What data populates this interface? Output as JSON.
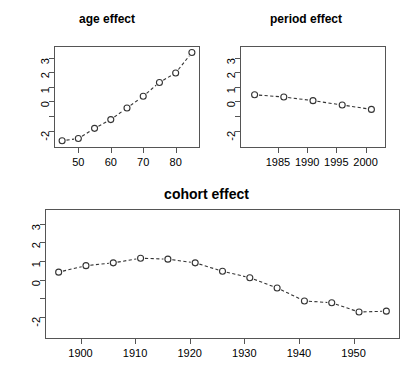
{
  "chart_data": [
    {
      "type": "line",
      "name": "age-effect",
      "title": "age effect",
      "xlabel": "",
      "ylabel": "",
      "x": [
        45,
        50,
        55,
        60,
        65,
        70,
        75,
        80,
        85
      ],
      "values": [
        -2.7,
        -2.55,
        -1.85,
        -1.25,
        -0.45,
        0.35,
        1.3,
        1.95,
        3.35
      ],
      "xlim": [
        42.5,
        87.5
      ],
      "ylim": [
        -3.2,
        3.8
      ],
      "xticks": [
        50,
        60,
        70,
        80
      ],
      "xtick_labels": [
        "50",
        "60",
        "70",
        "80"
      ],
      "yticks": [
        3,
        2,
        1,
        0,
        -1,
        -2
      ],
      "ytick_labels": [
        "3",
        "2",
        "1",
        "0",
        "",
        "-2"
      ],
      "grid": false,
      "legend": "none",
      "marker": "open-circle",
      "linestyle": "dashed"
    },
    {
      "type": "line",
      "name": "period-effect",
      "title": "period effect",
      "xlabel": "",
      "ylabel": "",
      "x": [
        1981,
        1986,
        1991,
        1996,
        2001
      ],
      "values": [
        0.45,
        0.3,
        0.05,
        -0.25,
        -0.55
      ],
      "xlim": [
        1978.5,
        2003.5
      ],
      "ylim": [
        -3.2,
        3.8
      ],
      "xticks": [
        1985,
        1990,
        1995,
        2000
      ],
      "xtick_labels": [
        "1985",
        "1990",
        "1995",
        "2000"
      ],
      "yticks": [
        3,
        2,
        1,
        0,
        -1,
        -2
      ],
      "ytick_labels": [
        "3",
        "2",
        "1",
        "0",
        "",
        "-2"
      ],
      "grid": false,
      "legend": "none",
      "marker": "open-circle",
      "linestyle": "dashed"
    },
    {
      "type": "line",
      "name": "cohort-effect",
      "title": "cohort effect",
      "xlabel": "",
      "ylabel": "",
      "x": [
        1896,
        1901,
        1906,
        1911,
        1916,
        1921,
        1926,
        1931,
        1936,
        1941,
        1946,
        1951,
        1956
      ],
      "values": [
        0.4,
        0.75,
        0.9,
        1.15,
        1.1,
        0.9,
        0.45,
        0.1,
        -0.45,
        -1.15,
        -1.25,
        -1.75,
        -1.7
      ],
      "xlim": [
        1893.5,
        1958.5
      ],
      "ylim": [
        -3.2,
        3.8
      ],
      "xticks": [
        1900,
        1910,
        1920,
        1930,
        1940,
        1950
      ],
      "xtick_labels": [
        "1900",
        "1910",
        "1920",
        "1930",
        "1940",
        "1950"
      ],
      "yticks": [
        3,
        2,
        1,
        0,
        -1,
        -2
      ],
      "ytick_labels": [
        "3",
        "2",
        "1",
        "0",
        "",
        "-2"
      ],
      "grid": false,
      "legend": "none",
      "marker": "open-circle",
      "linestyle": "dashed"
    }
  ],
  "style": {
    "axis_color": "#555555",
    "line_color": "#333333",
    "marker_edge_color": "#333333",
    "marker_fill_color": "#ffffff",
    "text_color": "#000000",
    "background": "#ffffff"
  }
}
